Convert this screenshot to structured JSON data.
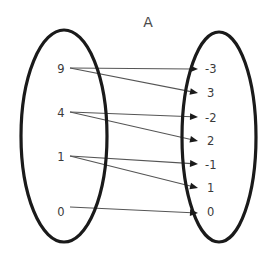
{
  "title": {
    "text": "A",
    "x": 148,
    "y": 27
  },
  "colors": {
    "background": "#ffffff",
    "outline": "#1a1a1a",
    "line": "#555555",
    "arrow": "#1a1a1a",
    "label": "#3a3a3a",
    "title": "#4a4a4a"
  },
  "domain_set": {
    "name": "domain-ellipse",
    "cx": 64,
    "cy": 136,
    "rx": 43,
    "ry": 106,
    "elements": [
      {
        "label": "9",
        "x": 61,
        "y": 73
      },
      {
        "label": "4",
        "x": 61,
        "y": 117
      },
      {
        "label": "1",
        "x": 61,
        "y": 161
      },
      {
        "label": "0",
        "x": 61,
        "y": 216
      }
    ]
  },
  "codomain_set": {
    "name": "codomain-ellipse",
    "cx": 219,
    "cy": 137,
    "rx": 37,
    "ry": 105,
    "elements": [
      {
        "label": "-3",
        "x": 205,
        "y": 73
      },
      {
        "label": "3",
        "x": 207,
        "y": 97
      },
      {
        "label": "-2",
        "x": 205,
        "y": 122
      },
      {
        "label": "2",
        "x": 207,
        "y": 145
      },
      {
        "label": "-1",
        "x": 205,
        "y": 169
      },
      {
        "label": "1",
        "x": 207,
        "y": 192
      },
      {
        "label": "0",
        "x": 207,
        "y": 216
      }
    ]
  },
  "mappings": [
    {
      "from": "9",
      "to": "-3",
      "x1": 70,
      "y1": 68,
      "x2": 198,
      "y2": 69
    },
    {
      "from": "9",
      "to": "3",
      "x1": 70,
      "y1": 68,
      "x2": 198,
      "y2": 93
    },
    {
      "from": "4",
      "to": "-2",
      "x1": 70,
      "y1": 112,
      "x2": 198,
      "y2": 117
    },
    {
      "from": "4",
      "to": "2",
      "x1": 70,
      "y1": 112,
      "x2": 198,
      "y2": 141
    },
    {
      "from": "1",
      "to": "-1",
      "x1": 70,
      "y1": 156,
      "x2": 198,
      "y2": 164
    },
    {
      "from": "1",
      "to": "1",
      "x1": 70,
      "y1": 156,
      "x2": 198,
      "y2": 188
    },
    {
      "from": "0",
      "to": "0",
      "x1": 70,
      "y1": 207,
      "x2": 198,
      "y2": 213
    }
  ]
}
